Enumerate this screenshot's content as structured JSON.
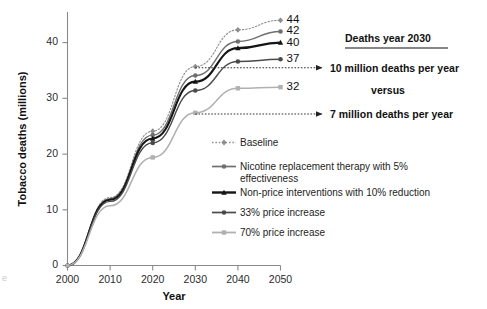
{
  "chart_data": {
    "type": "line",
    "title": "",
    "xlabel": "Year",
    "ylabel": "Tobacco deaths (millions)",
    "x": [
      2000,
      2010,
      2020,
      2030,
      2040,
      2050
    ],
    "xlim": [
      2000,
      2050
    ],
    "ylim": [
      0,
      45
    ],
    "xticks": [
      "2000",
      "2010",
      "2020",
      "2030",
      "2040",
      "2050"
    ],
    "yticks": [
      "0",
      "10",
      "20",
      "30",
      "40"
    ],
    "grid": false,
    "legend_position": "inside-lower-right",
    "series": [
      {
        "name": "Baseline",
        "values": [
          0,
          12.2,
          24.1,
          35.7,
          42.3,
          44.0
        ],
        "end_label": "44",
        "color": "#8d8d8d",
        "style": "dotted",
        "width": 1.1,
        "marker": "diamond"
      },
      {
        "name": "Nicotine replacement therapy with 5% effectiveness",
        "values": [
          0,
          12.0,
          23.4,
          34.1,
          40.2,
          42.0
        ],
        "end_label": "42",
        "color": "#6f6f6f",
        "style": "solid",
        "width": 1.4,
        "marker": "circle"
      },
      {
        "name": "Non-price interventions with 10% reduction",
        "values": [
          0,
          11.8,
          22.8,
          33.0,
          39.0,
          40.0
        ],
        "end_label": "40",
        "color": "#151515",
        "style": "solid",
        "width": 2.1,
        "marker": "triangle"
      },
      {
        "name": "33% price increase",
        "values": [
          0,
          11.5,
          22.0,
          31.4,
          36.6,
          37.0
        ],
        "end_label": "37",
        "color": "#4a4a4a",
        "style": "solid",
        "width": 1.4,
        "marker": "circle"
      },
      {
        "name": "70% price increase",
        "values": [
          0,
          10.7,
          19.4,
          27.4,
          31.8,
          32.0
        ],
        "end_label": "32",
        "color": "#b0b0b0",
        "style": "solid",
        "width": 1.5,
        "marker": "square"
      }
    ],
    "annotations": {
      "heading": "Deaths year 2030",
      "upper_arrow": {
        "label": "10 million deaths per year",
        "from_year": 2030,
        "value": 35.7
      },
      "middle_label": "versus",
      "lower_arrow": {
        "label": "7 million deaths per year",
        "from_year": 2030,
        "value": 27.4
      }
    }
  },
  "legend": {
    "items": [
      {
        "label": "Baseline"
      },
      {
        "label": "Nicotine replacement therapy with 5%"
      },
      {
        "label": "effectiveness"
      },
      {
        "label": "Non-price interventions with 10% reduction"
      },
      {
        "label": "33% price increase"
      },
      {
        "label": "70% price increase"
      }
    ]
  }
}
